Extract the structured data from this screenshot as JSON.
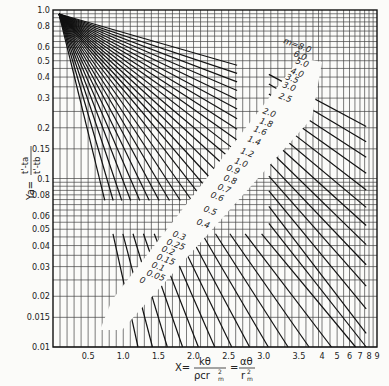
{
  "chart_data": {
    "type": "line",
    "title": "",
    "xlabel": "X = kθ / (ρ c r_m²) = αθ / r_m²",
    "xlabel_parts": {
      "lhs": "X=",
      "num1": "kθ",
      "den1": "ρcr",
      "sq1": "2",
      "sub1": "m",
      "eq": "=",
      "num2": "αθ",
      "den2": "r",
      "sq2": "2",
      "sub2": "m"
    },
    "ylabel": "Ya = (t' - ta) / (t' - tb)",
    "ylabel_parts": {
      "lhs": "Ya=",
      "num": "t'-ta",
      "den": "t'-tb"
    },
    "yscale": "log",
    "ylim": [
      0.01,
      1.0
    ],
    "y_ticks": [
      "0.01",
      "0.015",
      "0.02",
      "0.03",
      "0.04",
      "0.05",
      "0.06",
      "0.08",
      "0.1",
      "0.15",
      "0.2",
      "0.3",
      "0.4",
      "0.5",
      "0.6",
      "0.8",
      "1.0"
    ],
    "y_tick_values": [
      0.01,
      0.015,
      0.02,
      0.03,
      0.04,
      0.05,
      0.06,
      0.08,
      0.1,
      0.15,
      0.2,
      0.3,
      0.4,
      0.5,
      0.6,
      0.8,
      1.0
    ],
    "xscale": "linear 0–3.8, then log 4–9",
    "x_ticks": [
      "0.5",
      "1.0",
      "1.5",
      "2.0",
      "2.5",
      "3.0",
      "3.5",
      "4",
      "5",
      "6",
      "7",
      "8",
      "9"
    ],
    "x_tick_values": [
      0.5,
      1.0,
      1.5,
      2.0,
      2.5,
      3.0,
      3.5,
      4,
      5,
      6,
      7,
      8,
      9
    ],
    "grid": true,
    "legend": "none (curves labeled inline along diagonal)",
    "series_param": "m",
    "series": [
      {
        "name": "m=8.0",
        "label": "m=8.0"
      },
      {
        "name": "6.0",
        "label": "6.0"
      },
      {
        "name": "5.0",
        "label": "5.0"
      },
      {
        "name": "4.0",
        "label": "4.0"
      },
      {
        "name": "3.5",
        "label": "3.5"
      },
      {
        "name": "3.0",
        "label": "3.0"
      },
      {
        "name": "2.5",
        "label": "2.5"
      },
      {
        "name": "2.0",
        "label": "2.0"
      },
      {
        "name": "1.8",
        "label": "1.8"
      },
      {
        "name": "1.6",
        "label": "1.6"
      },
      {
        "name": "1.4",
        "label": "1.4"
      },
      {
        "name": "1.2",
        "label": "1.2"
      },
      {
        "name": "1.0",
        "label": "1.0"
      },
      {
        "name": "0.9",
        "label": "0.9"
      },
      {
        "name": "0.8",
        "label": "0.8"
      },
      {
        "name": "0.7",
        "label": "0.7"
      },
      {
        "name": "0.6",
        "label": "0.6"
      },
      {
        "name": "0.5",
        "label": "0.5"
      },
      {
        "name": "0.4",
        "label": "0.4"
      },
      {
        "name": "0.3",
        "label": "0.3"
      },
      {
        "name": "0.25",
        "label": "0.25"
      },
      {
        "name": "0.2",
        "label": "0.2"
      },
      {
        "name": "0.15",
        "label": "0.15"
      },
      {
        "name": "0.1",
        "label": "0.1"
      },
      {
        "name": "0.05",
        "label": "0.05"
      },
      {
        "name": "0",
        "label": "0"
      }
    ]
  }
}
